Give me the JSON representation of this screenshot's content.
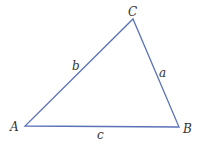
{
  "diagram": {
    "type": "triangle",
    "stroke_color": "#5a72b8",
    "vertices": [
      {
        "label": "A",
        "x": 25,
        "y": 126
      },
      {
        "label": "B",
        "x": 179,
        "y": 127
      },
      {
        "label": "C",
        "x": 133,
        "y": 19
      }
    ],
    "sides": [
      {
        "label": "a",
        "between": "B-C"
      },
      {
        "label": "b",
        "between": "A-C"
      },
      {
        "label": "c",
        "between": "A-B"
      }
    ]
  }
}
